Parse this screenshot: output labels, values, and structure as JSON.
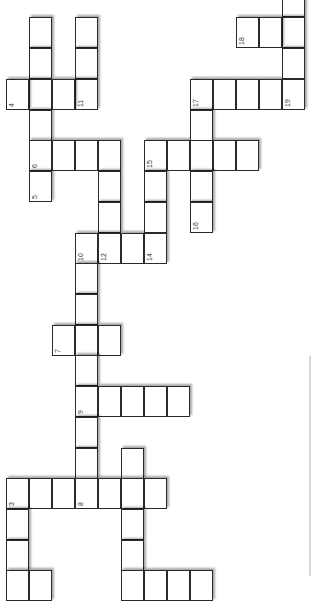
{
  "puzzle": {
    "type": "crossword",
    "orientation": "rotated-90",
    "cell_w": 23,
    "cell_h": 30.7,
    "cells": [
      {
        "x": 29,
        "y": 17,
        "n": ""
      },
      {
        "x": 29,
        "y": 48,
        "n": ""
      },
      {
        "x": 29,
        "y": 79,
        "n": ""
      },
      {
        "x": 29,
        "y": 110,
        "n": ""
      },
      {
        "x": 29,
        "y": 140,
        "n": "6"
      },
      {
        "x": 29,
        "y": 171,
        "n": "5"
      },
      {
        "x": 75,
        "y": 17,
        "n": ""
      },
      {
        "x": 75,
        "y": 48,
        "n": ""
      },
      {
        "x": 75,
        "y": 79,
        "n": "11"
      },
      {
        "x": 6,
        "y": 79,
        "n": "4"
      },
      {
        "x": 52,
        "y": 79,
        "n": ""
      },
      {
        "x": 52,
        "y": 140,
        "n": ""
      },
      {
        "x": 75,
        "y": 140,
        "n": ""
      },
      {
        "x": 98,
        "y": 140,
        "n": ""
      },
      {
        "x": 98,
        "y": 171,
        "n": ""
      },
      {
        "x": 98,
        "y": 202,
        "n": ""
      },
      {
        "x": 75,
        "y": 233,
        "n": "10"
      },
      {
        "x": 98,
        "y": 233,
        "n": "12"
      },
      {
        "x": 121,
        "y": 233,
        "n": ""
      },
      {
        "x": 144,
        "y": 233,
        "n": "14"
      },
      {
        "x": 144,
        "y": 140,
        "n": "15"
      },
      {
        "x": 144,
        "y": 171,
        "n": ""
      },
      {
        "x": 144,
        "y": 202,
        "n": ""
      },
      {
        "x": 167,
        "y": 140,
        "n": ""
      },
      {
        "x": 190,
        "y": 140,
        "n": ""
      },
      {
        "x": 213,
        "y": 140,
        "n": ""
      },
      {
        "x": 236,
        "y": 140,
        "n": ""
      },
      {
        "x": 190,
        "y": 79,
        "n": "17"
      },
      {
        "x": 190,
        "y": 110,
        "n": ""
      },
      {
        "x": 190,
        "y": 171,
        "n": ""
      },
      {
        "x": 190,
        "y": 202,
        "n": "16"
      },
      {
        "x": 213,
        "y": 79,
        "n": ""
      },
      {
        "x": 236,
        "y": 79,
        "n": ""
      },
      {
        "x": 259,
        "y": 79,
        "n": ""
      },
      {
        "x": 282,
        "y": 79,
        "n": "19"
      },
      {
        "x": 282,
        "y": -14,
        "n": ""
      },
      {
        "x": 282,
        "y": 17,
        "n": ""
      },
      {
        "x": 282,
        "y": 48,
        "n": ""
      },
      {
        "x": 236,
        "y": 17,
        "n": "18"
      },
      {
        "x": 259,
        "y": 17,
        "n": ""
      },
      {
        "x": 75,
        "y": 263,
        "n": ""
      },
      {
        "x": 75,
        "y": 294,
        "n": ""
      },
      {
        "x": 52,
        "y": 325,
        "n": "7"
      },
      {
        "x": 75,
        "y": 325,
        "n": ""
      },
      {
        "x": 98,
        "y": 325,
        "n": ""
      },
      {
        "x": 75,
        "y": 355,
        "n": ""
      },
      {
        "x": 75,
        "y": 386,
        "n": "9"
      },
      {
        "x": 98,
        "y": 386,
        "n": ""
      },
      {
        "x": 121,
        "y": 386,
        "n": ""
      },
      {
        "x": 144,
        "y": 386,
        "n": ""
      },
      {
        "x": 167,
        "y": 386,
        "n": ""
      },
      {
        "x": 75,
        "y": 417,
        "n": ""
      },
      {
        "x": 75,
        "y": 448,
        "n": ""
      },
      {
        "x": 121,
        "y": 448,
        "n": ""
      },
      {
        "x": 6,
        "y": 478,
        "n": "3"
      },
      {
        "x": 29,
        "y": 478,
        "n": ""
      },
      {
        "x": 52,
        "y": 478,
        "n": ""
      },
      {
        "x": 75,
        "y": 478,
        "n": "8"
      },
      {
        "x": 98,
        "y": 478,
        "n": ""
      },
      {
        "x": 121,
        "y": 478,
        "n": ""
      },
      {
        "x": 144,
        "y": 478,
        "n": ""
      },
      {
        "x": 6,
        "y": 509,
        "n": ""
      },
      {
        "x": 6,
        "y": 540,
        "n": ""
      },
      {
        "x": 6,
        "y": 570,
        "n": ""
      },
      {
        "x": 29,
        "y": 570,
        "n": ""
      },
      {
        "x": 121,
        "y": 509,
        "n": ""
      },
      {
        "x": 121,
        "y": 540,
        "n": ""
      },
      {
        "x": 121,
        "y": 570,
        "n": ""
      },
      {
        "x": 144,
        "y": 570,
        "n": ""
      },
      {
        "x": 167,
        "y": 570,
        "n": ""
      },
      {
        "x": 190,
        "y": 570,
        "n": ""
      }
    ]
  }
}
